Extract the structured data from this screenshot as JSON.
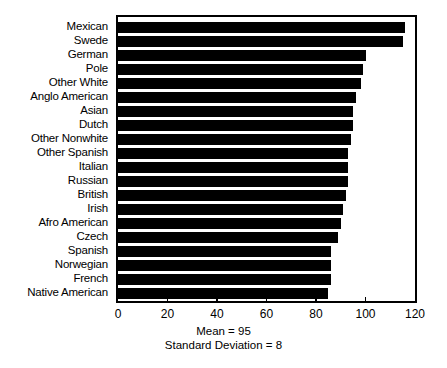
{
  "chart_data": {
    "type": "bar",
    "orientation": "horizontal",
    "title": "",
    "xlabel": "",
    "ylabel": "",
    "xlim": [
      0,
      120
    ],
    "ylim": null,
    "grid": false,
    "legend": null,
    "xticks": [
      0,
      20,
      40,
      60,
      80,
      100,
      120
    ],
    "xtick_labels": [
      "0",
      "20",
      "40",
      "60",
      "80",
      "100",
      "120"
    ],
    "categories": [
      "Mexican",
      "Swede",
      "German",
      "Pole",
      "Other White",
      "Anglo American",
      "Asian",
      "Dutch",
      "Other Nonwhite",
      "Other Spanish",
      "Italian",
      "Russian",
      "British",
      "Irish",
      "Afro American",
      "Czech",
      "Spanish",
      "Norwegian",
      "French",
      "Native American"
    ],
    "values": [
      116,
      115,
      100,
      99,
      98,
      96,
      95,
      95,
      94,
      93,
      93,
      93,
      92,
      91,
      90,
      89,
      86,
      86,
      86,
      85
    ],
    "annotations": [
      "Mean = 95",
      "Standard Deviation = 8"
    ],
    "colors": {
      "bar": "#000000",
      "axis": "#000000",
      "background": "#ffffff",
      "text": "#000000"
    }
  },
  "footer": {
    "mean_text": "Mean = 95",
    "sd_text": "Standard Deviation = 8"
  }
}
